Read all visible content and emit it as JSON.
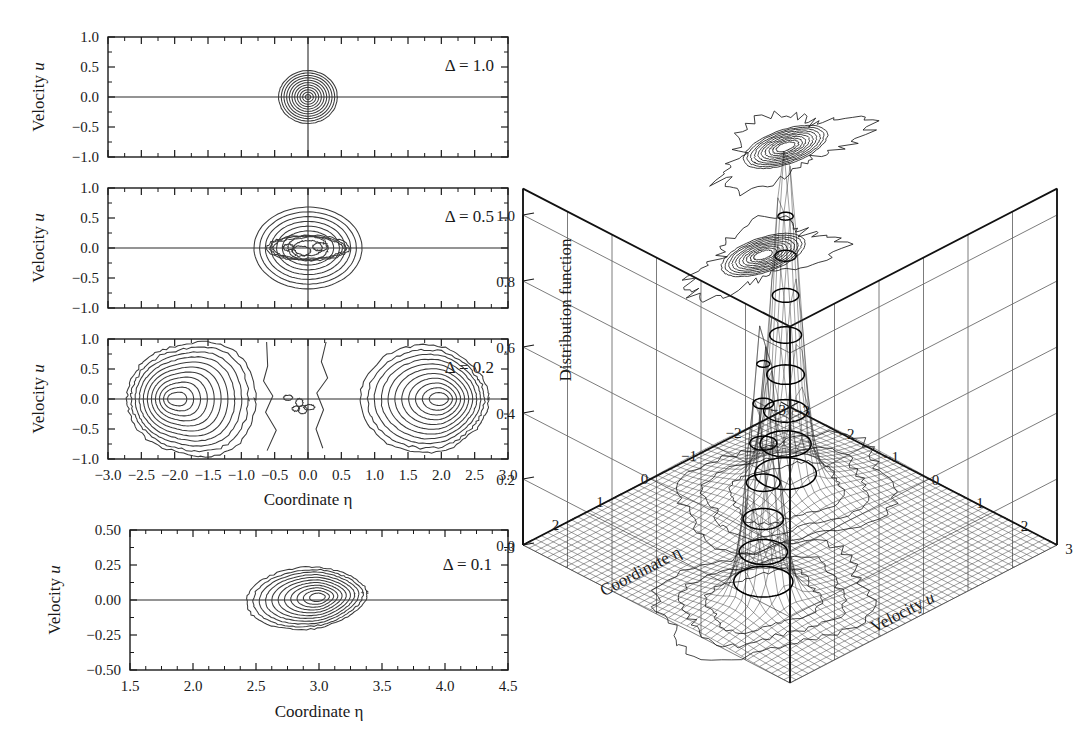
{
  "figure": {
    "kind": "scientific-figure"
  },
  "contour_panels": [
    {
      "id": "panel-delta-1",
      "label": "Δ = 1.0",
      "delta": 1.0,
      "ylabel": "Velocity u",
      "yticks": [
        "1.0",
        "0.5",
        "0.0",
        "-0.5",
        "-1.0"
      ],
      "ytick_values": [
        1.0,
        0.5,
        0.0,
        -0.5,
        -1.0
      ],
      "xlim": [
        -3.0,
        3.0
      ],
      "ylim": [
        -1.0,
        1.0
      ],
      "xticks_shown": false,
      "peak_centers": [
        [
          0.0,
          0.0
        ]
      ],
      "n_levels": 11
    },
    {
      "id": "panel-delta-05",
      "label": "Δ = 0.5",
      "delta": 0.5,
      "ylabel": "Velocity u",
      "yticks": [
        "1.0",
        "0.5",
        "0.0",
        "-0.5",
        "-1.0"
      ],
      "ytick_values": [
        1.0,
        0.5,
        0.0,
        -0.5,
        -1.0
      ],
      "xlim": [
        -3.0,
        3.0
      ],
      "ylim": [
        -1.0,
        1.0
      ],
      "xticks_shown": false,
      "peak_centers": [
        [
          -0.35,
          0.0
        ],
        [
          0.35,
          0.0
        ]
      ],
      "n_levels": 11
    },
    {
      "id": "panel-delta-02",
      "label": "Δ = 0.2",
      "delta": 0.2,
      "ylabel": "Velocity u",
      "yticks": [
        "1.0",
        "0.5",
        "0.0",
        "-0.5",
        "-1.0"
      ],
      "ytick_values": [
        1.0,
        0.5,
        0.0,
        -0.5,
        -1.0
      ],
      "xlim": [
        -3.0,
        3.0
      ],
      "ylim": [
        -1.0,
        1.0
      ],
      "xticks_shown": true,
      "xticks": [
        "-3.0",
        "-2.5",
        "-2.0",
        "-1.5",
        "-1.0",
        "-0.5",
        "0.0",
        "0.5",
        "1.0",
        "1.5",
        "2.0",
        "2.5",
        "3.0"
      ],
      "xtick_values": [
        -3.0,
        -2.5,
        -2.0,
        -1.5,
        -1.0,
        -0.5,
        0.0,
        0.5,
        1.0,
        1.5,
        2.0,
        2.5,
        3.0
      ],
      "xlabel": "Coordinate η",
      "peak_centers": [
        [
          -2.0,
          0.0
        ],
        [
          2.0,
          0.0
        ]
      ],
      "n_levels": 11
    }
  ],
  "bottom_panel": {
    "id": "panel-delta-01",
    "label": "Δ = 0.1",
    "delta": 0.1,
    "ylabel": "Velocity u",
    "yticks": [
      "0.50",
      "0.25",
      "0.00",
      "-0.25",
      "-0.50"
    ],
    "ytick_values": [
      0.5,
      0.25,
      0.0,
      -0.25,
      -0.5
    ],
    "xlabel": "Coordinate η",
    "xticks": [
      "1.5",
      "2.0",
      "2.5",
      "3.0",
      "3.5",
      "4.0",
      "4.5"
    ],
    "xtick_values": [
      1.5,
      2.0,
      2.5,
      3.0,
      3.5,
      4.0,
      4.5
    ],
    "xlim": [
      1.5,
      4.5
    ],
    "ylim": [
      -0.5,
      0.5
    ],
    "peak_centers": [
      [
        3.0,
        0.02
      ]
    ],
    "n_levels": 11
  },
  "surface_plot": {
    "id": "surface-3d",
    "zlabel": "Distribution function",
    "zticks": [
      "1.0",
      "0.8",
      "0.6",
      "0.4",
      "0.2",
      "0.0"
    ],
    "ztick_values": [
      1.0,
      0.8,
      0.6,
      0.4,
      0.2,
      0.0
    ],
    "zlim": [
      0.0,
      1.0
    ],
    "xlabel": "Coordinate η",
    "xticks": [
      "3",
      "2",
      "1",
      "0",
      "-1",
      "-2",
      "-3"
    ],
    "xtick_values": [
      3,
      2,
      1,
      0,
      -1,
      -2,
      -3
    ],
    "xlim": [
      -3,
      3
    ],
    "ylabel": "Velocity u",
    "yticks": [
      "-3",
      "-2",
      "-1",
      "0",
      "1",
      "2",
      "3"
    ],
    "ytick_values": [
      -3,
      -2,
      -1,
      0,
      1,
      2,
      3
    ],
    "ylim": [
      -3,
      3
    ],
    "peaks": [
      {
        "eta": -1.0,
        "u": -1.1,
        "height": 1.0
      },
      {
        "eta": 1.6,
        "u": 1.0,
        "height": 0.82
      }
    ],
    "ceiling_contours": true,
    "mesh_grid": true
  },
  "chart_data": {
    "type": "contour",
    "title": "",
    "panels": [
      {
        "name": "Δ = 1.0",
        "xlabel": "Coordinate η",
        "ylabel": "Velocity u",
        "xlim": [
          -3.0,
          3.0
        ],
        "ylim": [
          -1.0,
          1.0
        ],
        "peaks": [
          {
            "x": 0.0,
            "y": 0.0,
            "rx": 0.42,
            "ry": 0.42
          }
        ],
        "levels": 11
      },
      {
        "name": "Δ = 0.5",
        "xlabel": "Coordinate η",
        "ylabel": "Velocity u",
        "xlim": [
          -3.0,
          3.0
        ],
        "ylim": [
          -1.0,
          1.0
        ],
        "peaks": [
          {
            "x": -0.35,
            "y": 0.0,
            "rx": 1.35,
            "ry": 0.92
          },
          {
            "x": 0.35,
            "y": 0.0,
            "rx": 1.35,
            "ry": 0.92
          }
        ],
        "levels": 11
      },
      {
        "name": "Δ = 0.2",
        "xlabel": "Coordinate η",
        "ylabel": "Velocity u",
        "xlim": [
          -3.0,
          3.0
        ],
        "ylim": [
          -1.0,
          1.0
        ],
        "peaks": [
          {
            "x": -2.0,
            "y": 0.0,
            "rx": 1.55,
            "ry": 0.88
          },
          {
            "x": 2.0,
            "y": 0.0,
            "rx": 1.55,
            "ry": 0.88
          }
        ],
        "levels": 11
      },
      {
        "name": "Δ = 0.1",
        "xlabel": "Coordinate η",
        "ylabel": "Velocity u",
        "xlim": [
          1.5,
          4.5
        ],
        "ylim": [
          -0.5,
          0.5
        ],
        "peaks": [
          {
            "x": 3.0,
            "y": 0.02,
            "rx": 1.2,
            "ry": 0.4
          }
        ],
        "levels": 11
      }
    ],
    "surface": {
      "type": "surface",
      "zlabel": "Distribution function",
      "zlim": [
        0.0,
        1.0
      ],
      "xlabel": "Coordinate η",
      "xlim": [
        -3,
        3
      ],
      "ylabel": "Velocity u",
      "ylim": [
        -3,
        3
      ],
      "peaks": [
        {
          "eta": -1.0,
          "u": -1.1,
          "height": 1.0
        },
        {
          "eta": 1.6,
          "u": 1.0,
          "height": 0.82
        }
      ]
    }
  }
}
